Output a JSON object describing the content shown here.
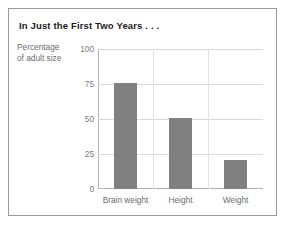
{
  "chart_data": {
    "type": "bar",
    "title": "In Just the First Two Years . . .",
    "xlabel": "",
    "ylabel": "Percentage of adult size",
    "ylabel_lines": [
      "Percentage",
      "of adult size"
    ],
    "categories": [
      "Brain weight",
      "Height",
      "Weight"
    ],
    "values": [
      76,
      51,
      21
    ],
    "ylim": [
      0,
      100
    ],
    "yticks": [
      0,
      25,
      50,
      75,
      100
    ],
    "ytick_labels": [
      "0",
      "25",
      "50",
      "75",
      "100"
    ],
    "grid": true,
    "legend": false,
    "bar_color": "#808080",
    "gridline_color": "#d8d8d8",
    "axis_color": "#b4b4b4",
    "title_color": "#1a1a1a",
    "label_color": "#6d6d6d",
    "border_color": "#9a9a9a",
    "background_color": "#ffffff"
  }
}
